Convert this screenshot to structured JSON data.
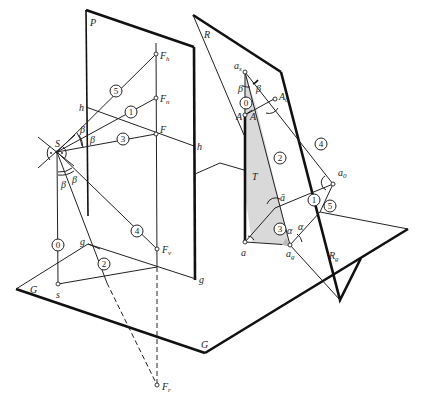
{
  "figure": {
    "planes": {
      "P": "P",
      "R": "R",
      "G_left": "G",
      "G_bottom": "G",
      "T": "T"
    },
    "points": {
      "S": "S",
      "s": "s",
      "F": "F",
      "F_h": "F",
      "F_h_sub": "h",
      "F_n": "F",
      "F_n_sub": "n",
      "F_v": "F",
      "F_v_sub": "v",
      "F_r": "F",
      "F_r_sub": "r",
      "a_s": "a",
      "a_s_sub": "s",
      "A_0": "A",
      "A_0_sub": "0",
      "a_0": "a",
      "a_0_sub": "0",
      "A_left": "A",
      "A_right": "A",
      "a": "a",
      "a_bar": "ā",
      "a_g": "a",
      "a_g_sub": "g",
      "R_g": "R",
      "R_g_sub": "g"
    },
    "lines": {
      "h_left": "h",
      "h_right": "h",
      "g_left": "g",
      "g_right": "g"
    },
    "angles": {
      "beta": "β",
      "alpha": "α"
    },
    "rays_left": [
      "5",
      "1",
      "3",
      "0",
      "4",
      "2"
    ],
    "rays_right": [
      "0",
      "2",
      "4",
      "1",
      "5",
      "3"
    ]
  }
}
